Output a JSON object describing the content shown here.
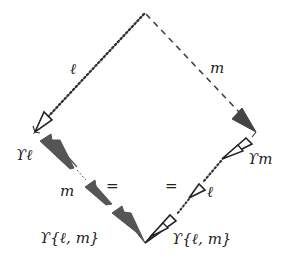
{
  "colors": {
    "stroke": "#333333",
    "fill_dark": "#555555",
    "background": "#ffffff"
  },
  "vertices": {
    "top": [
      144,
      14
    ],
    "left": [
      35,
      132
    ],
    "right": [
      256,
      132
    ],
    "bottom": [
      145,
      243
    ]
  },
  "edges": {
    "top_left": {
      "label": "ℓ",
      "style": "dotted",
      "arrowhead": "hollow"
    },
    "top_right": {
      "label": "m",
      "style": "dashed",
      "arrowhead": "filled"
    },
    "left_bottom": {
      "style": "filled-double-arrows",
      "labels": {
        "start": "ϒℓ",
        "middle": "m",
        "end": "ϒ{ℓ, m}"
      },
      "relation": "="
    },
    "right_bottom": {
      "style": "hollow-double-arrows",
      "labels": {
        "start": "ϒm",
        "middle": "ℓ",
        "end": "ϒ{ℓ, m}"
      },
      "relation": "="
    }
  }
}
